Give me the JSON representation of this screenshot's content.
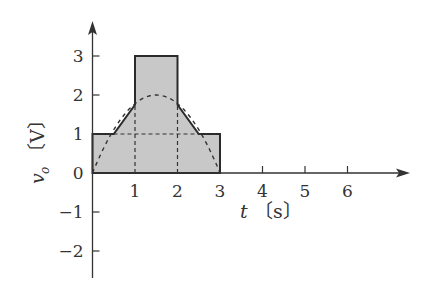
{
  "chart_data": {
    "type": "line",
    "title": "",
    "xlabel": "t [s]",
    "ylabel": "v_o [V]",
    "xlabel_var": "t",
    "xlabel_unit": "〔s〕",
    "ylabel_var": "v",
    "ylabel_sub": "o",
    "ylabel_unit": "〔V〕",
    "xlim": [
      0,
      7.3
    ],
    "ylim": [
      -2.6,
      3.8
    ],
    "x_ticks": [
      1,
      2,
      3,
      4,
      5,
      6
    ],
    "x_tick_labels": [
      "1",
      "2",
      "3",
      "4",
      "5",
      "6"
    ],
    "y_ticks": [
      3,
      2,
      1,
      0,
      -1,
      -2
    ],
    "y_tick_labels": [
      "3",
      "2",
      "1",
      "0",
      "−1",
      "−2"
    ],
    "grid": false,
    "series": [
      {
        "name": "v_o (shaded solid outline)",
        "style": "solid, gray fill",
        "fill": "#c8c8c8",
        "points": [
          [
            0,
            0
          ],
          [
            0,
            1
          ],
          [
            0.5,
            1
          ],
          [
            1,
            1.75
          ],
          [
            1,
            3
          ],
          [
            2,
            3
          ],
          [
            2,
            1.75
          ],
          [
            2.5,
            1
          ],
          [
            3,
            1
          ],
          [
            3,
            0
          ]
        ]
      },
      {
        "name": "parabola (dashed)",
        "style": "dashed",
        "points": [
          [
            0,
            0
          ],
          [
            0.5,
            1.11
          ],
          [
            1,
            1.78
          ],
          [
            1.5,
            2
          ],
          [
            2,
            1.78
          ],
          [
            2.5,
            1.11
          ],
          [
            3,
            0
          ]
        ]
      },
      {
        "name": "guide lines (dashed)",
        "style": "dashed",
        "segments": [
          [
            [
              0,
              1
            ],
            [
              3,
              1
            ]
          ],
          [
            [
              1,
              0
            ],
            [
              1,
              1.75
            ]
          ],
          [
            [
              2,
              0
            ],
            [
              2,
              1.75
            ]
          ]
        ]
      }
    ]
  }
}
